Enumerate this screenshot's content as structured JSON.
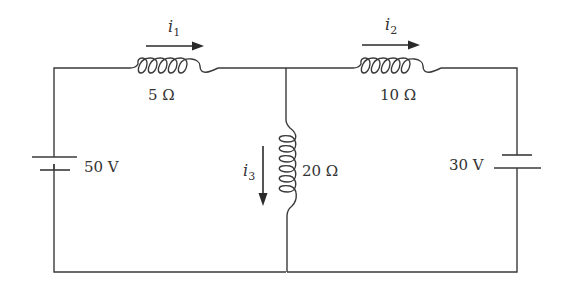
{
  "diagram": {
    "type": "electrical circuit",
    "components": {
      "battery_left": {
        "label": "50 V"
      },
      "battery_right": {
        "label": "30 V"
      },
      "inductor_top_left": {
        "label": "5 Ω"
      },
      "inductor_top_right": {
        "label": "10 Ω"
      },
      "inductor_middle": {
        "label": "20 Ω"
      }
    },
    "currents": {
      "i1": {
        "symbol": "i",
        "subscript": "1",
        "direction": "right"
      },
      "i2": {
        "symbol": "i",
        "subscript": "2",
        "direction": "right"
      },
      "i3": {
        "symbol": "i",
        "subscript": "3",
        "direction": "down"
      }
    },
    "colors": {
      "line": "#3a3a3a",
      "background": "#ffffff"
    }
  }
}
